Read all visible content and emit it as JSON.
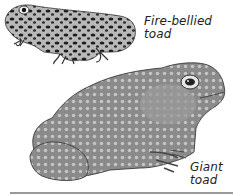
{
  "illustration": {
    "subjects": [
      {
        "id": "fire-bellied-toad",
        "label_line1": "Fire-bellied",
        "label_line2": "toad"
      },
      {
        "id": "giant-toad",
        "label_line1": "Giant",
        "label_line2": "toad"
      }
    ]
  },
  "colors": {
    "background": "#ffffff",
    "label_text": "#222222",
    "rule": "#9a9a9a"
  }
}
